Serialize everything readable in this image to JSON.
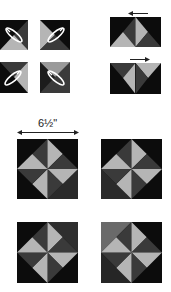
{
  "colors": {
    "black": "#0c0c0c",
    "dark": "#3a3a3a",
    "mid": "#5a5a5a",
    "light": "#b5b5b5",
    "iron": "#ffffff"
  },
  "step1": {
    "description": "Half-square triangle units pressed with iron",
    "units": [
      {
        "id": "unit-1",
        "icon": "iron-icon"
      },
      {
        "id": "unit-2",
        "icon": "iron-icon"
      },
      {
        "id": "unit-3",
        "icon": "iron-icon"
      },
      {
        "id": "unit-4",
        "icon": "iron-icon"
      }
    ]
  },
  "step2": {
    "rows": [
      {
        "id": "row-1",
        "press_direction": "left",
        "arrow": "arrow-left-icon"
      },
      {
        "id": "row-2",
        "press_direction": "right",
        "arrow": "arrow-right-icon"
      }
    ]
  },
  "step3": {
    "measurement_label": "6½\"",
    "blocks": [
      {
        "id": "block-1"
      },
      {
        "id": "block-2"
      },
      {
        "id": "block-3"
      },
      {
        "id": "block-4"
      }
    ]
  }
}
